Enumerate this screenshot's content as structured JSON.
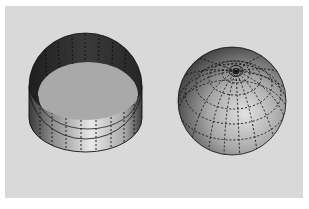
{
  "figure": {
    "background_color": "#ffffff",
    "panel_color": "#d9d9d9",
    "objects": [
      {
        "name": "open-cylinder",
        "shape": "cylinder",
        "description": "Open-topped cylinder shell with dashed vertical meridian lines; grey inner floor",
        "outer_color_dark": "#2e2e2e",
        "outer_color_light": "#e6e6e6",
        "floor_color": "#a9a9a9",
        "meridian_count": 16
      },
      {
        "name": "latitude-longitude-sphere",
        "shape": "sphere",
        "description": "Shaded sphere with dashed latitude and longitude grid lines converging at a pole near the top",
        "shade_dark": "#202020",
        "shade_light": "#d8d8d8",
        "latitude_count": 6,
        "longitude_count": 16
      }
    ]
  }
}
